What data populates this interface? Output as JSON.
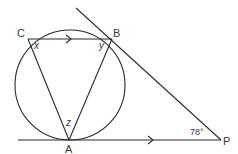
{
  "diagram": {
    "type": "circle-geometry",
    "circle": {
      "cx": 70,
      "cy": 85,
      "r": 55
    },
    "points": {
      "A": {
        "label": "A",
        "x": 69,
        "y": 140
      },
      "B": {
        "label": "B",
        "x": 112,
        "y": 39
      },
      "C": {
        "label": "C",
        "x": 28,
        "y": 39
      },
      "P": {
        "label": "P",
        "x": 221,
        "y": 140
      }
    },
    "angles": {
      "x": "x",
      "y": "y",
      "z": "z",
      "p": "78°"
    },
    "segments": [
      {
        "from": "C",
        "to": "B",
        "parallel_arrow": true
      },
      {
        "from": "C",
        "to": "A"
      },
      {
        "from": "B",
        "to": "A"
      },
      {
        "from": "tangent_top_start",
        "to": "P",
        "through": "B"
      },
      {
        "from": "tangent_bottom_start",
        "to": "P",
        "through": "A",
        "parallel_arrow": true
      }
    ],
    "colors": {
      "line": "#2a2a2a",
      "text": "#3a3a3a",
      "background": "#ffffff"
    }
  }
}
